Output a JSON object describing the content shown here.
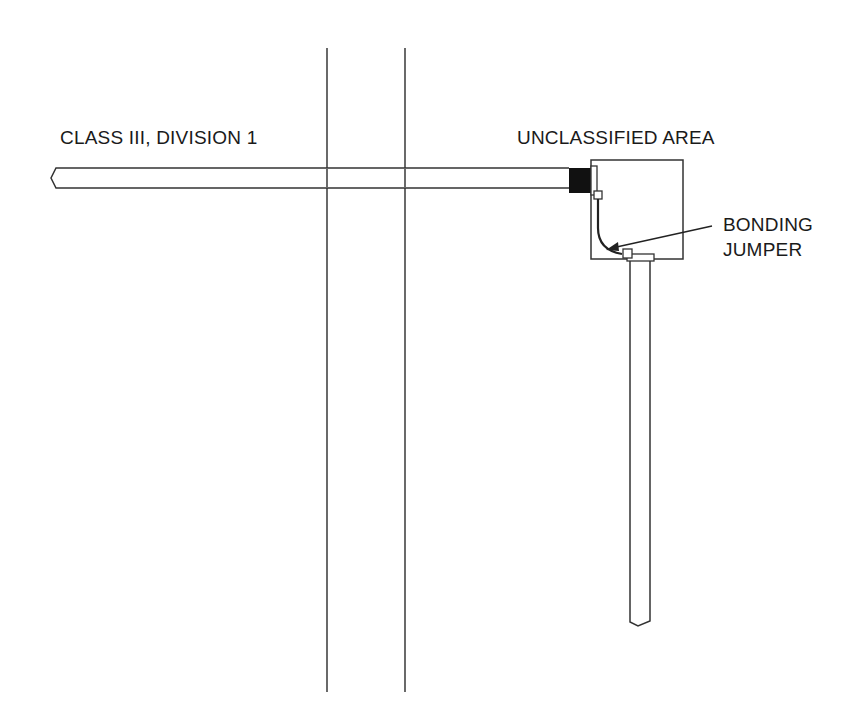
{
  "diagram": {
    "type": "wiring-diagram",
    "labels": {
      "hazardous_area": "CLASS III, DIVISION 1",
      "unclassified_area": "UNCLASSIFIED AREA",
      "bonding_jumper_line1": "BONDING",
      "bonding_jumper_line2": "JUMPER"
    },
    "elements": [
      {
        "name": "wall",
        "description": "double vertical lines separating areas"
      },
      {
        "name": "horizontal-conduit",
        "description": "conduit running from hazardous area into enclosure"
      },
      {
        "name": "conduit-seal",
        "description": "black filled seal at enclosure entry"
      },
      {
        "name": "enclosure-box",
        "description": "junction box in unclassified area"
      },
      {
        "name": "bonding-jumper",
        "description": "curved jumper between conduit entries"
      },
      {
        "name": "vertical-conduit",
        "description": "conduit exiting bottom of enclosure"
      }
    ],
    "colors": {
      "line": "#333333",
      "seal": "#111111",
      "background": "#ffffff"
    }
  }
}
